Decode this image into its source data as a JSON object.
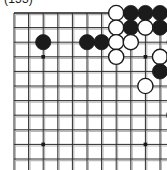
{
  "figure": {
    "caption": "(153)",
    "kind": "go-board-diagram"
  },
  "board": {
    "columns": 11,
    "rows": 11,
    "origin_x": 14,
    "origin_y": 13,
    "spacing": 14.6,
    "line_color": "#2a2a2a",
    "edge_color": "#1a1a1a",
    "shadow_color": "#b9b9b9",
    "background": "#ffffff",
    "stone_radius": 7.6,
    "star_points": [
      {
        "col": 2,
        "row": 3
      },
      {
        "col": 2,
        "row": 9
      },
      {
        "col": 9,
        "row": 3
      },
      {
        "col": 9,
        "row": 9
      }
    ],
    "edges": {
      "top": true,
      "right": true,
      "left": false,
      "bottom": false
    }
  },
  "stones": [
    {
      "col": 7,
      "row": 0,
      "color": "white",
      "label": ""
    },
    {
      "col": 8,
      "row": 0,
      "color": "black",
      "label": ""
    },
    {
      "col": 9,
      "row": 0,
      "color": "black",
      "label": ""
    },
    {
      "col": 10,
      "row": 0,
      "color": "black",
      "label": ""
    },
    {
      "col": 7,
      "row": 1,
      "color": "white",
      "label": ""
    },
    {
      "col": 8,
      "row": 1,
      "color": "black",
      "label": ""
    },
    {
      "col": 9,
      "row": 1,
      "color": "white",
      "label": ""
    },
    {
      "col": 10,
      "row": 1,
      "color": "black",
      "label": ""
    },
    {
      "col": 12,
      "row": 1,
      "color": "white",
      "label": ""
    },
    {
      "col": 2,
      "row": 2,
      "color": "black",
      "label": ""
    },
    {
      "col": 5,
      "row": 2,
      "color": "black",
      "label": ""
    },
    {
      "col": 6,
      "row": 2,
      "color": "black",
      "label": ""
    },
    {
      "col": 7,
      "row": 2,
      "color": "white",
      "label": ""
    },
    {
      "col": 8,
      "row": 2,
      "color": "white",
      "label": ""
    },
    {
      "col": 11,
      "row": 2,
      "color": "black",
      "label": ""
    },
    {
      "col": 12,
      "row": 2,
      "color": "black",
      "label": ""
    },
    {
      "col": 7,
      "row": 3,
      "color": "white",
      "label": ""
    },
    {
      "col": 10,
      "row": 3,
      "color": "white",
      "label": ""
    },
    {
      "col": 11,
      "row": 3,
      "color": "white",
      "label": ""
    },
    {
      "col": 12,
      "row": 3,
      "color": "black",
      "label": "triangle"
    },
    {
      "col": 10,
      "row": 4,
      "color": "black",
      "label": ""
    },
    {
      "col": 9,
      "row": 5,
      "color": "white",
      "label": ""
    },
    {
      "col": 11,
      "row": 7,
      "color": "white",
      "label": ""
    }
  ]
}
